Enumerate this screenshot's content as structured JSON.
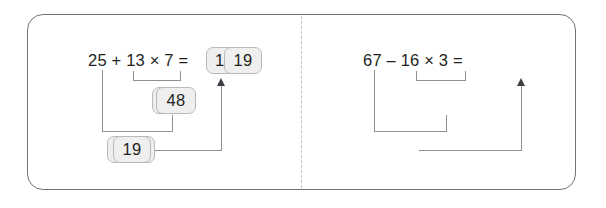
{
  "figure": {
    "border_color": "#6f7378",
    "divider_color": "#c3c3c3",
    "box_fill": "#efefef",
    "box_border": "#b9babb",
    "connector_color": "#8d9094",
    "text_color": "#231f20"
  },
  "panels": [
    {
      "id": "left",
      "expression": "25 + 13 × 7 =",
      "operands": [
        "25",
        "13",
        "7"
      ],
      "operators": [
        "+",
        "×"
      ],
      "result_box": "116",
      "intermediate_box": "91",
      "sum_box": "116",
      "steps": [
        {
          "label": "13 × 7",
          "value": "91"
        },
        {
          "label": "25 + 91",
          "value": "116"
        }
      ]
    },
    {
      "id": "right",
      "expression": "67 – 16 × 3 =",
      "operands": [
        "67",
        "16",
        "3"
      ],
      "operators": [
        "–",
        "×"
      ],
      "result_box": "19",
      "intermediate_box": "48",
      "sum_box": "19",
      "steps": [
        {
          "label": "16 × 3",
          "value": "48"
        },
        {
          "label": "67 – 48",
          "value": "19"
        }
      ]
    }
  ]
}
